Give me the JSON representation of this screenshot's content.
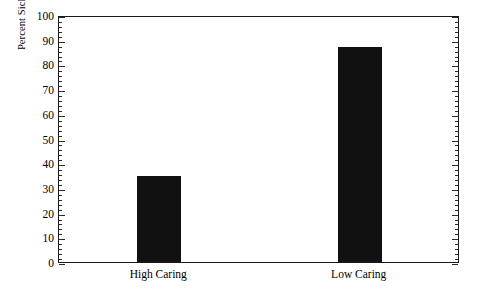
{
  "chart_data": {
    "type": "bar",
    "title": "",
    "xlabel": "",
    "ylabel": "Percent Sick Subjects (0 to 100)",
    "categories": [
      "High Caring",
      "Low Caring"
    ],
    "values": [
      35,
      87
    ],
    "ylim": [
      0,
      100
    ],
    "yticks": [
      0,
      10,
      20,
      30,
      40,
      50,
      60,
      70,
      80,
      90,
      100
    ],
    "ytick_labels": [
      "0",
      "10",
      "20",
      "30",
      "40",
      "50",
      "60",
      "70",
      "80",
      "90",
      "100"
    ],
    "grid": false,
    "legend": "none",
    "bar_color": "#111111",
    "frame_color": "#1a1a1a",
    "background_color": "#ffffff",
    "minor_ticks_per_interval": 5
  },
  "axes": {
    "y_title": "Percent Sick Subjects (0 to 100)",
    "y_label_0": "0",
    "y_label_10": "10",
    "y_label_20": "20",
    "y_label_30": "30",
    "y_label_40": "40",
    "y_label_50": "50",
    "y_label_60": "60",
    "y_label_70": "70",
    "y_label_80": "80",
    "y_label_90": "90",
    "y_label_100": "100",
    "x_label_1": "High Caring",
    "x_label_2": "Low Caring"
  }
}
